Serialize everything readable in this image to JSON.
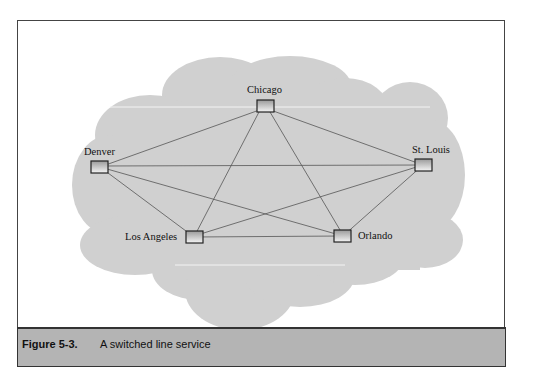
{
  "figure": {
    "label": "Figure 5-3.",
    "caption": "A switched line service"
  },
  "diagram": {
    "cloud_color": "#cfcfcf",
    "line_color": "#555555",
    "nodes": [
      {
        "id": "chicago",
        "label": "Chicago"
      },
      {
        "id": "denver",
        "label": "Denver"
      },
      {
        "id": "st_louis",
        "label": "St. Louis"
      },
      {
        "id": "los_angeles",
        "label": "Los Angeles"
      },
      {
        "id": "orlando",
        "label": "Orlando"
      }
    ],
    "edges": [
      [
        "chicago",
        "denver"
      ],
      [
        "chicago",
        "st_louis"
      ],
      [
        "chicago",
        "los_angeles"
      ],
      [
        "chicago",
        "orlando"
      ],
      [
        "denver",
        "st_louis"
      ],
      [
        "denver",
        "los_angeles"
      ],
      [
        "denver",
        "orlando"
      ],
      [
        "st_louis",
        "los_angeles"
      ],
      [
        "st_louis",
        "orlando"
      ],
      [
        "los_angeles",
        "orlando"
      ]
    ]
  }
}
